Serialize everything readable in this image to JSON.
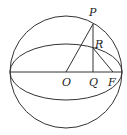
{
  "diagram": {
    "type": "sphere-geometry",
    "labels": {
      "P": "P",
      "R": "R",
      "O": "O",
      "Q": "Q",
      "F": "F"
    },
    "points": {
      "O": [
        66,
        72
      ],
      "P": [
        93,
        24
      ],
      "R": [
        93,
        48
      ],
      "Q": [
        93,
        72
      ],
      "F": [
        113,
        72
      ]
    },
    "circle": {
      "cx": 66,
      "cy": 72,
      "r": 56
    },
    "ellipse": {
      "cx": 66,
      "cy": 72,
      "rx": 56,
      "ry": 28
    },
    "segments": [
      [
        "O",
        "P"
      ],
      [
        "P",
        "Q"
      ],
      [
        "R",
        "F"
      ],
      [
        "left",
        "right"
      ]
    ],
    "colors": {
      "stroke": "#333333",
      "text": "#222222"
    }
  }
}
